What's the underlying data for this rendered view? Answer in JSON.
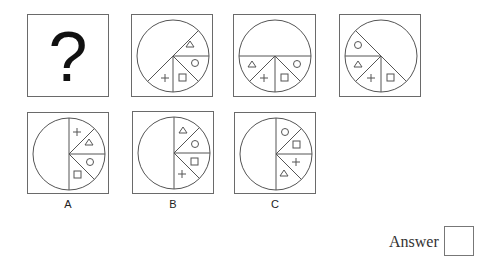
{
  "question_panel": {
    "symbol": "?"
  },
  "sequence": [
    {
      "id": "fig-1",
      "start_angle": 45,
      "sectors": [
        "triangle",
        "circle",
        "square",
        "plus"
      ]
    },
    {
      "id": "fig-2",
      "start_angle": 180,
      "sectors": [
        "triangle",
        "plus",
        "square",
        "circle"
      ],
      "direction": "ccw"
    },
    {
      "id": "fig-3",
      "start_angle": 135,
      "sectors": [
        "circle",
        "triangle",
        "plus",
        "square"
      ],
      "direction": "ccw"
    }
  ],
  "options": [
    {
      "label": "A",
      "sectors": [
        "plus",
        "triangle",
        "circle",
        "square"
      ]
    },
    {
      "label": "B",
      "sectors": [
        "triangle",
        "circle",
        "square",
        "plus"
      ]
    },
    {
      "label": "C",
      "sectors": [
        "circle",
        "square",
        "plus",
        "triangle"
      ]
    }
  ],
  "answer": {
    "label": "Answer",
    "value": ""
  },
  "colors": {
    "stroke": "#555555",
    "border": "#6a6a6a",
    "background": "#ffffff"
  }
}
